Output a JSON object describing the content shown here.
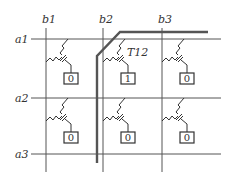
{
  "diagram": {
    "type": "memory-cell-array",
    "columns": [
      {
        "label": "b1",
        "x": 46
      },
      {
        "label": "b2",
        "x": 103
      },
      {
        "label": "b3",
        "x": 162
      }
    ],
    "rows": [
      {
        "label": "a1",
        "y": 39
      },
      {
        "label": "a2",
        "y": 98
      },
      {
        "label": "a3",
        "y": 154
      }
    ],
    "highlighted_transistor": "T12",
    "cells": [
      {
        "row": 1,
        "col": 1,
        "value": "0"
      },
      {
        "row": 1,
        "col": 2,
        "value": "1"
      },
      {
        "row": 1,
        "col": 3,
        "value": "0"
      },
      {
        "row": 2,
        "col": 1,
        "value": "0"
      },
      {
        "row": 2,
        "col": 2,
        "value": "0"
      },
      {
        "row": 2,
        "col": 3,
        "value": "0"
      }
    ],
    "colors": {
      "line": "#555555",
      "text": "#333333",
      "background": "#ffffff"
    }
  }
}
